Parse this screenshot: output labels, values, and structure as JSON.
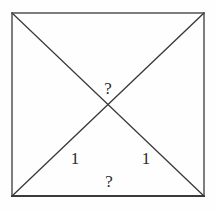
{
  "figure": {
    "background_color": "#fefefe",
    "stroke_color": "#3a3a3a",
    "text_color": "#2b2b2b",
    "square": {
      "left": 12,
      "top": 13,
      "right": 204,
      "bottom": 196,
      "width": 192,
      "height": 183,
      "border_width": 1.3,
      "bottom_border_width": 2
    },
    "diagonals": [
      {
        "name": "diagonal-tl-br",
        "x1": 12,
        "y1": 13,
        "x2": 204,
        "y2": 196
      },
      {
        "name": "diagonal-tr-bl",
        "x1": 204,
        "y1": 13,
        "x2": 12,
        "y2": 196
      }
    ],
    "intersection": {
      "x": 108,
      "y": 105
    },
    "labels": [
      {
        "name": "label-question-top",
        "text": "?",
        "x": 108,
        "y": 88
      },
      {
        "name": "label-one-left",
        "text": "1",
        "x": 75,
        "y": 158
      },
      {
        "name": "label-one-right",
        "text": "1",
        "x": 146,
        "y": 158
      },
      {
        "name": "label-question-bottom",
        "text": "?",
        "x": 109,
        "y": 181
      }
    ]
  },
  "chart_data": {
    "type": "diagram",
    "shapes": [
      {
        "kind": "square",
        "points": [
          [
            12,
            13
          ],
          [
            204,
            13
          ],
          [
            204,
            196
          ],
          [
            12,
            196
          ]
        ]
      },
      {
        "kind": "line",
        "points": [
          [
            12,
            13
          ],
          [
            204,
            196
          ]
        ]
      },
      {
        "kind": "line",
        "points": [
          [
            204,
            13
          ],
          [
            12,
            196
          ]
        ]
      }
    ],
    "annotations": [
      {
        "text": "?",
        "x": 108,
        "y": 88,
        "position": "above-intersection"
      },
      {
        "text": "1",
        "x": 75,
        "y": 158,
        "position": "lower-left-triangle"
      },
      {
        "text": "1",
        "x": 146,
        "y": 158,
        "position": "lower-right-triangle"
      },
      {
        "text": "?",
        "x": 109,
        "y": 181,
        "position": "near-bottom-edge"
      }
    ]
  }
}
